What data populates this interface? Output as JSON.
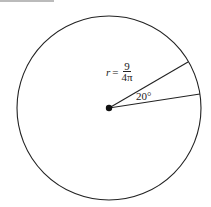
{
  "diagram": {
    "radius_label": {
      "variable": "r",
      "equals": "=",
      "numerator": "9",
      "denominator": "4π"
    },
    "angle_label": "20°",
    "stroke_color": "#222222"
  }
}
